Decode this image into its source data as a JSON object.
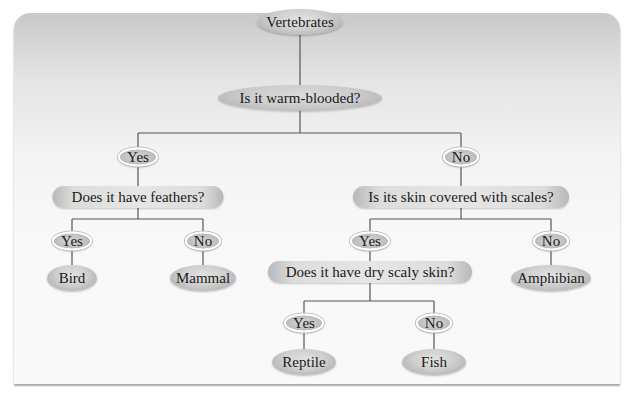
{
  "diagram": {
    "type": "dichotomous-key",
    "root": "Vertebrates",
    "questions": {
      "q1": "Is it warm-blooded?",
      "q2": "Does it have feathers?",
      "q3": "Is its skin covered with scales?",
      "q4": "Does it have dry scaly skin?"
    },
    "answers": {
      "q1_yes": "Yes",
      "q1_no": "No",
      "q2_yes": "Yes",
      "q2_no": "No",
      "q3_yes": "Yes",
      "q3_no": "No",
      "q4_yes": "Yes",
      "q4_no": "No"
    },
    "leaves": {
      "bird": "Bird",
      "mammal": "Mammal",
      "amphibian": "Amphibian",
      "reptile": "Reptile",
      "fish": "Fish"
    },
    "colors": {
      "node_gray": "#cccccc",
      "line": "#555555",
      "answer_ring": "#ffffff"
    }
  }
}
